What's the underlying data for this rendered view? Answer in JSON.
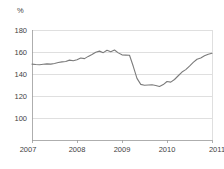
{
  "chart_data": {
    "type": "line",
    "title": "",
    "subtitle": "",
    "xlabel": "",
    "ylabel": "",
    "unit_label": "%",
    "grid": "horizontal",
    "legend": "none",
    "xlim": [
      2007.0,
      2011.0
    ],
    "ylim": [
      80,
      180
    ],
    "y_ticks": [
      100,
      120,
      140,
      160,
      180
    ],
    "y_tick_labels": [
      "100",
      "120",
      "140",
      "160",
      "180"
    ],
    "x_ticks": [
      2007,
      2008,
      2009,
      2010,
      2011
    ],
    "x_tick_labels": [
      "2007",
      "2008",
      "2009",
      "2010",
      "2011"
    ],
    "line_color": "#7b7b7b",
    "series": [
      {
        "name": "index",
        "x": [
          2007.0,
          2007.083,
          2007.167,
          2007.25,
          2007.333,
          2007.417,
          2007.5,
          2007.583,
          2007.667,
          2007.75,
          2007.833,
          2007.917,
          2008.0,
          2008.083,
          2008.167,
          2008.25,
          2008.333,
          2008.417,
          2008.5,
          2008.583,
          2008.667,
          2008.75,
          2008.833,
          2008.917,
          2009.0,
          2009.083,
          2009.167,
          2009.25,
          2009.333,
          2009.417,
          2009.5,
          2009.583,
          2009.667,
          2009.75,
          2009.833,
          2009.917,
          2010.0,
          2010.083,
          2010.167,
          2010.25,
          2010.333,
          2010.417,
          2010.5,
          2010.583,
          2010.667,
          2010.75,
          2010.833,
          2010.917,
          2011.0
        ],
        "values": [
          149.0,
          148.6,
          148.4,
          148.8,
          149.2,
          149.0,
          149.6,
          150.4,
          151.0,
          151.4,
          152.6,
          152.0,
          153.0,
          154.6,
          154.0,
          156.0,
          157.8,
          159.8,
          160.8,
          159.4,
          161.6,
          160.2,
          161.8,
          159.2,
          157.4,
          157.2,
          157.0,
          147.0,
          136.0,
          130.6,
          129.8,
          130.0,
          130.2,
          129.6,
          128.6,
          130.4,
          133.2,
          132.6,
          135.0,
          138.4,
          141.8,
          144.0,
          147.2,
          150.6,
          153.4,
          154.6,
          156.6,
          158.0,
          158.8
        ]
      }
    ]
  },
  "axes": {
    "unit": "%"
  }
}
